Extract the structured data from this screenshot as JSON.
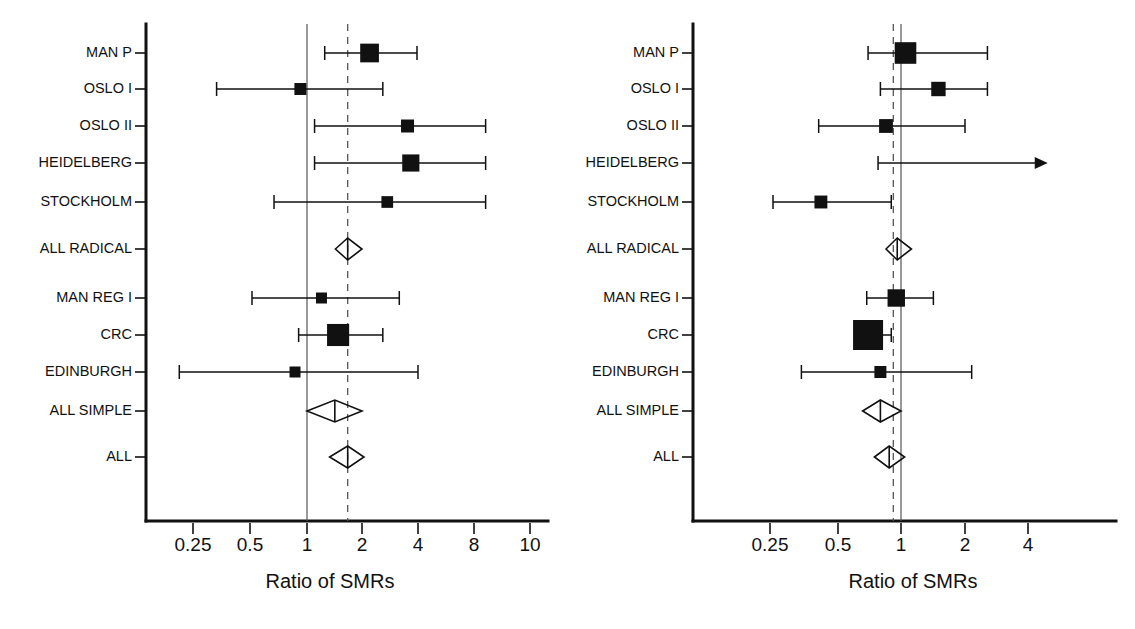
{
  "figure": {
    "type": "forest-plot-pair",
    "background": "#ffffff",
    "ink_color": "#111111",
    "reference_color": "#555555"
  },
  "chart_data": [
    {
      "type": "forest",
      "panel_id": "left",
      "title": "",
      "xlabel": "Ratio of SMRs",
      "ylabel": "",
      "xscale": "log",
      "xlim": [
        0.17,
        11.5
      ],
      "ticks": [
        {
          "value": 0.25,
          "label": "0.25"
        },
        {
          "value": 0.5,
          "label": "0.5"
        },
        {
          "value": 1,
          "label": "1"
        },
        {
          "value": 2,
          "label": "2"
        },
        {
          "value": 4,
          "label": "4"
        },
        {
          "value": 8,
          "label": "8"
        },
        {
          "value": 10,
          "label": "10"
        }
      ],
      "reference_lines": [
        {
          "value": 1,
          "style": "solid"
        },
        {
          "value": 1.67,
          "style": "dashed"
        }
      ],
      "grid": false,
      "legend": "none",
      "rows": [
        {
          "label": "MAN P",
          "marker": "square",
          "estimate": 2.2,
          "ci_low": 1.25,
          "ci_high": 4.0,
          "weight": 0.72,
          "clipped": false
        },
        {
          "label": "OSLO I",
          "marker": "square",
          "estimate": 0.92,
          "ci_low": 0.32,
          "ci_high": 2.6,
          "weight": 0.46,
          "clipped": false
        },
        {
          "label": "OSLO II",
          "marker": "square",
          "estimate": 3.55,
          "ci_low": 1.1,
          "ci_high": 9.5,
          "weight": 0.5,
          "clipped": false
        },
        {
          "label": "HEIDELBERG",
          "marker": "square",
          "estimate": 3.7,
          "ci_low": 1.1,
          "ci_high": 9.5,
          "weight": 0.66,
          "clipped": false
        },
        {
          "label": "STOCKHOLM",
          "marker": "square",
          "estimate": 2.75,
          "ci_low": 0.66,
          "ci_high": 9.5,
          "weight": 0.45,
          "clipped": false
        },
        {
          "label": "ALL RADICAL",
          "marker": "diamond",
          "estimate": 1.67,
          "ci_low": 1.43,
          "ci_high": 2.0,
          "weight": 0.0,
          "clipped": false
        },
        {
          "label": "MAN REG I",
          "marker": "square",
          "estimate": 1.2,
          "ci_low": 0.5,
          "ci_high": 3.2,
          "weight": 0.42,
          "clipped": false
        },
        {
          "label": "CRC",
          "marker": "square",
          "estimate": 1.48,
          "ci_low": 0.9,
          "ci_high": 2.6,
          "weight": 0.85,
          "clipped": false
        },
        {
          "label": "EDINBURGH",
          "marker": "square",
          "estimate": 0.86,
          "ci_low": 0.2,
          "ci_high": 4.05,
          "weight": 0.42,
          "clipped": false
        },
        {
          "label": "ALL SIMPLE",
          "marker": "diamond",
          "estimate": 1.42,
          "ci_low": 1.0,
          "ci_high": 2.0,
          "weight": 0.0,
          "clipped": false
        },
        {
          "label": "ALL",
          "marker": "diamond",
          "estimate": 1.67,
          "ci_low": 1.33,
          "ci_high": 2.05,
          "weight": 0.0,
          "clipped": false
        }
      ]
    },
    {
      "type": "forest",
      "panel_id": "right",
      "title": "",
      "xlabel": "Ratio of SMRs",
      "ylabel": "",
      "xscale": "log",
      "xlim": [
        0.19,
        6.2
      ],
      "ticks": [
        {
          "value": 0.25,
          "label": "0.25"
        },
        {
          "value": 0.5,
          "label": "0.5"
        },
        {
          "value": 1,
          "label": "1"
        },
        {
          "value": 2,
          "label": "2"
        },
        {
          "value": 4,
          "label": "4"
        }
      ],
      "reference_lines": [
        {
          "value": 1,
          "style": "solid"
        },
        {
          "value": 0.92,
          "style": "dashed"
        }
      ],
      "grid": false,
      "legend": "none",
      "rows": [
        {
          "label": "MAN P",
          "marker": "square",
          "estimate": 1.05,
          "ci_low": 0.7,
          "ci_high": 2.55,
          "weight": 0.72,
          "clipped": false
        },
        {
          "label": "OSLO I",
          "marker": "square",
          "estimate": 1.5,
          "ci_low": 0.8,
          "ci_high": 2.55,
          "weight": 0.48,
          "clipped": false
        },
        {
          "label": "OSLO II",
          "marker": "square",
          "estimate": 0.85,
          "ci_low": 0.41,
          "ci_high": 2.0,
          "weight": 0.46,
          "clipped": false
        },
        {
          "label": "HEIDELBERG",
          "marker": "none",
          "estimate": null,
          "ci_low": 0.78,
          "ci_high": 4.9,
          "weight": 0.0,
          "clipped": true
        },
        {
          "label": "STOCKHOLM",
          "marker": "square",
          "estimate": 0.42,
          "ci_low": 0.25,
          "ci_high": 0.9,
          "weight": 0.43,
          "clipped": false
        },
        {
          "label": "ALL RADICAL",
          "marker": "diamond",
          "estimate": 0.96,
          "ci_low": 0.85,
          "ci_high": 1.12,
          "weight": 0.0,
          "clipped": false
        },
        {
          "label": "MAN REG I",
          "marker": "square",
          "estimate": 0.95,
          "ci_low": 0.69,
          "ci_high": 1.42,
          "weight": 0.58,
          "clipped": false
        },
        {
          "label": "CRC",
          "marker": "square",
          "estimate": 0.7,
          "ci_low": 0.61,
          "ci_high": 0.9,
          "weight": 1.0,
          "clipped": false
        },
        {
          "label": "EDINBURGH",
          "marker": "square",
          "estimate": 0.8,
          "ci_low": 0.34,
          "ci_high": 2.15,
          "weight": 0.4,
          "clipped": false
        },
        {
          "label": "ALL SIMPLE",
          "marker": "diamond",
          "estimate": 0.8,
          "ci_low": 0.66,
          "ci_high": 1.0,
          "weight": 0.0,
          "clipped": false
        },
        {
          "label": "ALL",
          "marker": "diamond",
          "estimate": 0.88,
          "ci_low": 0.75,
          "ci_high": 1.04,
          "weight": 0.0,
          "clipped": false
        }
      ]
    }
  ]
}
